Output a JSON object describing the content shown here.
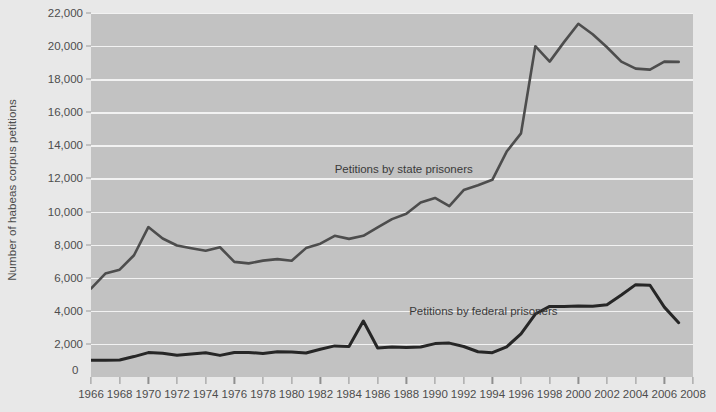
{
  "chart_data": {
    "type": "line",
    "title": "",
    "xlabel": "",
    "ylabel": "Number of habeas corpus petitions",
    "xlim": [
      1966,
      2008
    ],
    "ylim": [
      0,
      22000
    ],
    "grid": true,
    "legend_position": "inline-annotations",
    "y_ticks": [
      0,
      2000,
      4000,
      6000,
      8000,
      10000,
      12000,
      14000,
      16000,
      18000,
      20000,
      22000
    ],
    "y_tick_labels": [
      "0",
      "2,000",
      "4,000",
      "6,000",
      "8,000",
      "10,000",
      "12,000",
      "14,000",
      "16,000",
      "18,000",
      "20,000",
      "22,000"
    ],
    "x_ticks": [
      1966,
      1968,
      1970,
      1972,
      1974,
      1976,
      1978,
      1980,
      1982,
      1984,
      1986,
      1988,
      1990,
      1992,
      1994,
      1996,
      1998,
      2000,
      2002,
      2004,
      2006,
      2008
    ],
    "x_tick_labels": [
      "1966",
      "1968",
      "1970",
      "1972",
      "1974",
      "1976",
      "1978",
      "1980",
      "1982",
      "1984",
      "1986",
      "1988",
      "1990",
      "1992",
      "1994",
      "1996",
      "1998",
      "2000",
      "2002",
      "2004",
      "2006",
      "2008"
    ],
    "x": [
      1966,
      1967,
      1968,
      1969,
      1970,
      1971,
      1972,
      1973,
      1974,
      1975,
      1976,
      1977,
      1978,
      1979,
      1980,
      1981,
      1982,
      1983,
      1984,
      1985,
      1986,
      1987,
      1988,
      1989,
      1990,
      1991,
      1992,
      1993,
      1994,
      1995,
      1996,
      1997,
      1998,
      1999,
      2000,
      2001,
      2002,
      2003,
      2004,
      2005,
      2006,
      2007
    ],
    "series": [
      {
        "name": "Petitions by state prisoners",
        "color": "#4d4d4d",
        "annotation": "Petitions by state prisoners",
        "values": [
          5339,
          6248,
          6488,
          7359,
          9063,
          8372,
          7949,
          7784,
          7626,
          7843,
          6958,
          6866,
          7033,
          7123,
          7031,
          7790,
          8059,
          8532,
          8349,
          8534,
          9045,
          9542,
          9867,
          10545,
          10823,
          10325,
          11296,
          11587,
          11918,
          13627,
          14726,
          19992,
          19062,
          20240,
          21349,
          20716,
          19928,
          19062,
          18637,
          18578,
          19064,
          19046
        ]
      },
      {
        "name": "Petitions by federal prisoners",
        "color": "#262626",
        "annotation": "Petitions by federal prisoners",
        "values": [
          1009,
          1008,
          1028,
          1234,
          1475,
          1438,
          1321,
          1389,
          1469,
          1306,
          1479,
          1484,
          1427,
          1524,
          1504,
          1447,
          1680,
          1879,
          1844,
          3382,
          1756,
          1812,
          1780,
          1816,
          2018,
          2049,
          1844,
          1525,
          1468,
          1824,
          2608,
          3806,
          4266,
          4261,
          4294,
          4282,
          4372,
          4960,
          5583,
          5546,
          4223,
          3285
        ]
      }
    ]
  },
  "axis": {
    "zero_label": "0"
  }
}
